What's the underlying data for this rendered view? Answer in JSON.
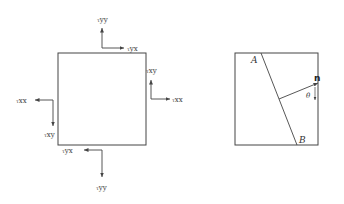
{
  "left_diagram": {
    "labels": {
      "tyy_top": {
        "sym": "τ",
        "sub": "yy"
      },
      "tyx_top": {
        "sym": "τ",
        "sub": "yx"
      },
      "txy_right": {
        "sym": "τ",
        "sub": "xy"
      },
      "txx_right": {
        "sym": "τ",
        "sub": "xx"
      },
      "txx_left": {
        "sym": "τ",
        "sub": "xx"
      },
      "txy_left": {
        "sym": "τ",
        "sub": "xy"
      },
      "tyx_bottom": {
        "sym": "τ",
        "sub": "yx"
      },
      "tyy_bottom": {
        "sym": "τ",
        "sub": "yy"
      }
    }
  },
  "right_diagram": {
    "point_a": "A",
    "point_b": "B",
    "normal": "n",
    "angle": "θ"
  },
  "colors": {
    "stroke": "#444444"
  }
}
